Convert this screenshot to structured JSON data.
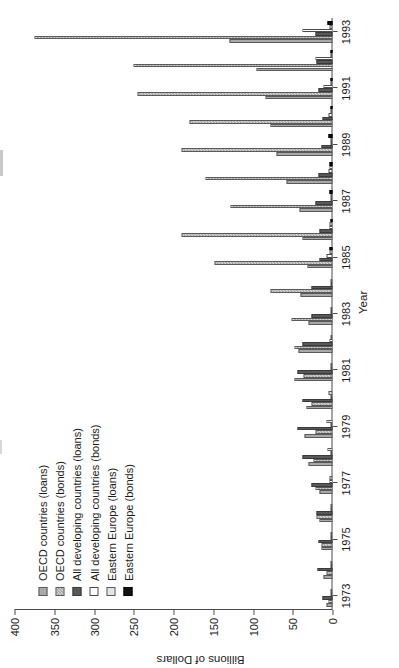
{
  "chart_data": {
    "type": "bar",
    "orientation": "horizontal-rotated",
    "title": "",
    "xlabel": "Year",
    "ylabel": "Billions of Dollars",
    "ylim": [
      0,
      400
    ],
    "ytick_step": 50,
    "yticks": [
      0,
      50,
      100,
      150,
      200,
      250,
      300,
      350,
      400
    ],
    "ytick_labels": [
      "0",
      "50",
      "100",
      "150",
      "200",
      "250",
      "300",
      "350",
      "400"
    ],
    "grid": false,
    "legend_position": "upper-left",
    "categories": [
      "1973",
      "1974",
      "1975",
      "1976",
      "1977",
      "1978",
      "1979",
      "1980",
      "1981",
      "1982",
      "1983",
      "1984",
      "1985",
      "1986",
      "1987",
      "1988",
      "1989",
      "1990",
      "1991",
      "1992",
      "1993"
    ],
    "xtick_labels": [
      "1973",
      "1975",
      "1977",
      "1979",
      "1981",
      "1983",
      "1985",
      "1987",
      "1989",
      "1991",
      "1993"
    ],
    "series": [
      {
        "name": "OECD countries (loans)",
        "color": "#a9a9a9",
        "pattern": "solid-grey",
        "values": [
          8,
          11,
          14,
          16,
          17,
          30,
          35,
          33,
          48,
          43,
          30,
          40,
          32,
          38,
          42,
          58,
          70,
          78,
          84,
          96,
          130
        ]
      },
      {
        "name": "OECD countries (bonds)",
        "color": "#d9d9d9",
        "pattern": "checkered",
        "values": [
          5,
          8,
          14,
          20,
          22,
          24,
          22,
          26,
          36,
          48,
          52,
          78,
          148,
          190,
          128,
          160,
          190,
          180,
          245,
          250,
          375
        ]
      },
      {
        "name": "All developing countries (loans)",
        "color": "#595959",
        "pattern": "solid-dark",
        "values": [
          12,
          19,
          18,
          20,
          26,
          38,
          44,
          38,
          44,
          38,
          26,
          26,
          16,
          17,
          21,
          18,
          14,
          13,
          18,
          20,
          22
        ]
      },
      {
        "name": "All developing countries (bonds)",
        "color": "#ffffff",
        "pattern": "white",
        "values": [
          1,
          1,
          1,
          2,
          4,
          3,
          2,
          2,
          3,
          4,
          2,
          2,
          8,
          4,
          3,
          5,
          3,
          5,
          11,
          22,
          38
        ]
      },
      {
        "name": "Eastern Europe (loans)",
        "color": "#e4e4e4",
        "pattern": "light-grey",
        "values": [
          1,
          2,
          3,
          3,
          4,
          6,
          8,
          5,
          3,
          2,
          1,
          2,
          4,
          4,
          3,
          4,
          3,
          2,
          3,
          3,
          4
        ]
      },
      {
        "name": "Eastern Europe (bonds)",
        "color": "#111111",
        "pattern": "black",
        "values": [
          0,
          0,
          0,
          0,
          0,
          0,
          0,
          0,
          0,
          0,
          0,
          0,
          4,
          3,
          4,
          4,
          5,
          2,
          2,
          3,
          6
        ]
      }
    ]
  },
  "axes": {
    "x_title": "Year",
    "y_title": "Billions of Dollars"
  },
  "legend": {
    "items": [
      {
        "label": "OECD countries (loans)"
      },
      {
        "label": "OECD countries (bonds)"
      },
      {
        "label": "All developing countries (loans)"
      },
      {
        "label": "All developing countries (bonds)"
      },
      {
        "label": "Eastern Europe (loans)"
      },
      {
        "label": "Eastern Europe (bonds)"
      }
    ]
  }
}
